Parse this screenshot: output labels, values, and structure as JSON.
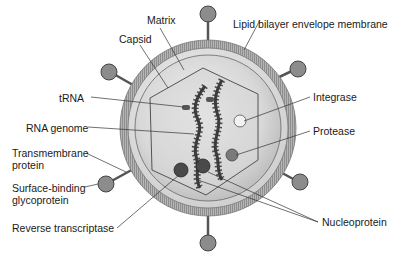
{
  "diagram": {
    "labels": {
      "matrix": "Matrix",
      "capsid": "Capsid",
      "lipid_envelope": "Lipid bilayer envelope membrane",
      "trna": "tRNA",
      "integrase": "Integrase",
      "rna_genome": "RNA genome",
      "protease": "Protease",
      "transmembrane_line1": "Transmembrane",
      "transmembrane_line2": "protein",
      "glycoprotein_line1": "Surface-binding",
      "glycoprotein_line2": "glycoprotein",
      "reverse_transcriptase": "Reverse transcriptase",
      "nucleoprotein": "Nucleoprotein"
    },
    "colors": {
      "envelope": "#a9a9a9",
      "matrix": "#dcdcdc",
      "capsid_fill": "#d4d4d4",
      "spike_head": "#8c8c8c",
      "enzyme_dark": "#4a4a4a",
      "integrase": "#f2f2f2",
      "protease": "#7a7a7a",
      "rna": "#3c3c3c",
      "leader_line": "#333333"
    }
  }
}
